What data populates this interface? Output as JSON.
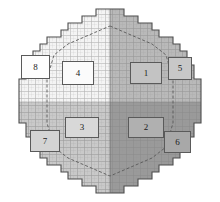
{
  "figure": {
    "kind": "circular-mesh-quadrant-diagram",
    "background_color": "#ffffff",
    "outline_color": "#4d4d4d",
    "grid_line_color": "#8f8f8f",
    "inner_boundary_color": "#5a5a5a",
    "circle": {
      "cx": 110,
      "cy": 101,
      "rx": 94,
      "ry": 92
    },
    "dividers": {
      "vertical_x": 110,
      "horizontal_y": 102
    }
  },
  "quadrants": [
    {
      "name": "top-left",
      "fill": "#f2f2f2"
    },
    {
      "name": "top-right",
      "fill": "#b9b9b9"
    },
    {
      "name": "bottom-left",
      "fill": "#c9c9c9"
    },
    {
      "name": "bottom-right",
      "fill": "#a3a3a3"
    }
  ],
  "labels": [
    {
      "id": "1",
      "text": "1",
      "x": 130,
      "y": 62,
      "w": 30,
      "h": 20,
      "fill": "#c3c3c3"
    },
    {
      "id": "2",
      "text": "2",
      "x": 128,
      "y": 117,
      "w": 34,
      "h": 19,
      "fill": "#b0b0b0"
    },
    {
      "id": "3",
      "text": "3",
      "x": 65,
      "y": 117,
      "w": 32,
      "h": 19,
      "fill": "#d8d8d8"
    },
    {
      "id": "4",
      "text": "4",
      "x": 62,
      "y": 61,
      "w": 30,
      "h": 22,
      "fill": "#fbfbfb"
    },
    {
      "id": "5",
      "text": "5",
      "x": 168,
      "y": 57,
      "w": 22,
      "h": 21,
      "fill": "#c8c8c8"
    },
    {
      "id": "6",
      "text": "6",
      "x": 164,
      "y": 131,
      "w": 25,
      "h": 20,
      "fill": "#a8a8a8"
    },
    {
      "id": "7",
      "text": "7",
      "x": 30,
      "y": 130,
      "w": 28,
      "h": 20,
      "fill": "#d4d4d4"
    },
    {
      "id": "8",
      "text": "8",
      "x": 21,
      "y": 55,
      "w": 27,
      "h": 22,
      "fill": "#fdfdfd"
    }
  ]
}
